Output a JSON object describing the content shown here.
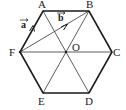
{
  "diagram": {
    "type": "geometry",
    "title": "",
    "shape": "regular-hexagon",
    "vertices": {
      "A": {
        "label": "A",
        "x": 43,
        "y": 11,
        "lx": 42,
        "ly": 7
      },
      "B": {
        "label": "B",
        "x": 89,
        "y": 11,
        "lx": 90,
        "ly": 7
      },
      "C": {
        "label": "C",
        "x": 112,
        "y": 52,
        "lx": 117,
        "ly": 56
      },
      "D": {
        "label": "D",
        "x": 89,
        "y": 93,
        "lx": 89,
        "ly": 105
      },
      "E": {
        "label": "E",
        "x": 43,
        "y": 93,
        "lx": 42,
        "ly": 105
      },
      "F": {
        "label": "F",
        "x": 20,
        "y": 52,
        "lx": 12,
        "ly": 56
      }
    },
    "center": {
      "label": "O",
      "x": 66,
      "y": 52,
      "lx": 76,
      "ly": 51
    },
    "edges": [
      "AB",
      "BC",
      "CD",
      "DE",
      "EF",
      "FA"
    ],
    "diagonals": [
      "AD",
      "BE",
      "FC",
      "FB"
    ],
    "vectors": [
      {
        "name": "a",
        "label": "a",
        "from": "F",
        "to": "A",
        "lx": 22,
        "ly": 27
      },
      {
        "name": "b",
        "label": "b",
        "from": "F",
        "to": "B",
        "lx": 59,
        "ly": 20
      }
    ],
    "colors": {
      "stroke": "#1a1a1a",
      "background": "#ffffff"
    }
  }
}
